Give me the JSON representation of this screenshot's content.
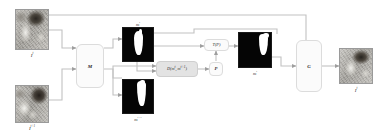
{
  "diagram": {
    "accent_line_color": "#b9b9b9",
    "block_fill_color": "#fbfbfb",
    "block_fill_gray": "#e3e3e3",
    "mask_fg_color": "#ffffff",
    "mask_bg_color": "#050505"
  },
  "inputs": {
    "frame_t": {
      "caption": "I",
      "sup": "t",
      "name": "input-frame-t"
    },
    "frame_t1": {
      "caption": "I",
      "sup": "t+1",
      "name": "input-frame-t1"
    }
  },
  "blocks": {
    "matcher": {
      "label": "M"
    },
    "distance": {
      "label": "D(m",
      "sup1": "t",
      "mid": ", m",
      "sup2": "t+1",
      "tail": ")"
    },
    "distance_full": "D(m^t, m^t+1)",
    "param": {
      "label": "P"
    },
    "transform": {
      "label": "T(P)"
    },
    "generator": {
      "label": "G"
    }
  },
  "masks": {
    "mask_t": {
      "caption": "m",
      "sup": "t"
    },
    "mask_t1": {
      "caption": "m",
      "sup": "t+1"
    },
    "mask_warped": {
      "caption": "m",
      "sup": "t",
      "sub": "w"
    }
  },
  "output": {
    "frame_out": {
      "caption": "I",
      "sup": "t",
      "name": "output-frame"
    }
  }
}
